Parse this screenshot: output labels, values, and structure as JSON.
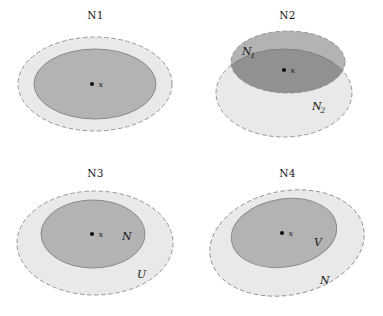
{
  "figure": {
    "caption_type": "neighborhood-axiom-diagrams",
    "panel_count": 4
  },
  "colors": {
    "outer_fill": "#e9e9e9",
    "inner_fill": "#b3b3b3",
    "overlap_fill": "#919191",
    "stroke_dashed": "#8c8c8c",
    "stroke_solid": "#8a8a8a",
    "point": "#111111",
    "text": "#1a1a1a",
    "background": "#ffffff"
  },
  "panels": [
    {
      "id": "n1",
      "title": "N1",
      "point_label": "x",
      "labels": []
    },
    {
      "id": "n2",
      "title": "N2",
      "point_label": "x",
      "labels": [
        {
          "base": "N",
          "sub": "1"
        },
        {
          "base": "N",
          "sub": "2"
        }
      ]
    },
    {
      "id": "n3",
      "title": "N3",
      "point_label": "x",
      "labels": [
        {
          "base": "N",
          "sub": ""
        },
        {
          "base": "U",
          "sub": ""
        }
      ]
    },
    {
      "id": "n4",
      "title": "N4",
      "point_label": "x",
      "labels": [
        {
          "base": "V",
          "sub": ""
        },
        {
          "base": "N",
          "sub": ""
        }
      ]
    }
  ]
}
